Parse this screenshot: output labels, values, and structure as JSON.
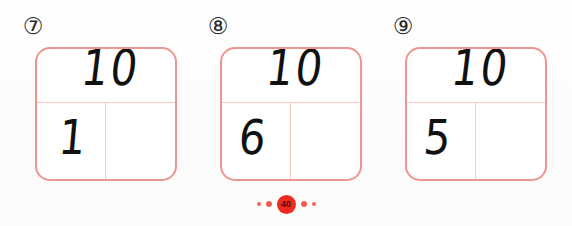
{
  "page": {
    "badge_number": "40",
    "accent_color": "#ee2b22",
    "box_border_color": "#ef9590",
    "grid_line_color": "#f6c9c6",
    "ink_color": "#111111"
  },
  "problems": [
    {
      "index_label": "⑦",
      "index_number": "7",
      "total_value": "10",
      "part_value": "1",
      "empty_part": ""
    },
    {
      "index_label": "⑧",
      "index_number": "8",
      "total_value": "10",
      "part_value": "6",
      "empty_part": ""
    },
    {
      "index_label": "⑨",
      "index_number": "9",
      "total_value": "10",
      "part_value": "5",
      "empty_part": ""
    }
  ],
  "decoration": {
    "left_dots": [
      "dot-small",
      "dot-medium"
    ],
    "right_dots": [
      "dot-medium",
      "dot-small"
    ]
  }
}
